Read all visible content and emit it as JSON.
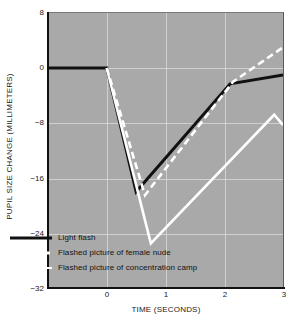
{
  "chart_data": {
    "type": "line",
    "title": "",
    "xlabel": "TIME (SECONDS)",
    "ylabel": "PUPIL SIZE CHANGE (MILLIMETERS)",
    "xlim": [
      -1.0,
      3.0
    ],
    "ylim": [
      -32,
      8
    ],
    "xticks": [
      0,
      1,
      2,
      3
    ],
    "xtick_labels": [
      "0",
      "1",
      "2",
      "3"
    ],
    "yticks": [
      8,
      0,
      -8,
      -16,
      -24,
      -32
    ],
    "ytick_labels": [
      "8",
      "0",
      "−8",
      "−16",
      "−24",
      "−32"
    ],
    "grid": true,
    "legend_position": "lower-left-inside",
    "background_color": "#a9a9a9",
    "series": [
      {
        "name": "Light flash",
        "style": "solid",
        "color": "#111111",
        "x": [
          -1.0,
          0.0,
          0.5,
          2.1,
          3.0
        ],
        "y": [
          0,
          0,
          -18,
          -2.3,
          -1.0
        ]
      },
      {
        "name": "Flashed picture of female nude",
        "style": "dashed",
        "color": "#ffffff",
        "x": [
          0.0,
          0.65,
          2.15,
          3.0
        ],
        "y": [
          0,
          -18.5,
          -2.0,
          3.0
        ]
      },
      {
        "name": "Flashed picture of concentration camp",
        "style": "solid",
        "color": "#ffffff",
        "x": [
          0.0,
          0.75,
          2.85,
          3.0
        ],
        "y": [
          0,
          -25.5,
          -6.8,
          -8.3
        ]
      }
    ],
    "legend": [
      {
        "label": "Light flash",
        "style": "solid",
        "color": "#111111"
      },
      {
        "label": "Flashed picture of female nude",
        "style": "dashed",
        "color": "#ffffff"
      },
      {
        "label": "Flashed picture of concentration camp",
        "style": "solid",
        "color": "#ffffff"
      }
    ]
  }
}
